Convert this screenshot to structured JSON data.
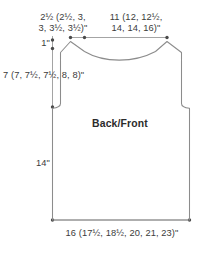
{
  "schematic": {
    "piece_name": "Back/Front",
    "labels": {
      "shoulder_width": "2½ (2½, 3,\n3, 3½, 3½)\"",
      "shoulder_width_line1": "2½ (2½, 3,",
      "shoulder_width_line2": "3, 3½, 3½)\"",
      "upper_width_line1": "11 (12, 12½,",
      "upper_width_line2": "14, 14, 16)\"",
      "neck_depth": "1\"",
      "armhole_depth": "7 (7, 7½, 7½, 8, 8)\"",
      "body_length": "14\"",
      "bottom_width": "16 (17½, 18½, 20, 21, 23)\""
    },
    "colors": {
      "outline": "#8c8c8c",
      "dimension_line": "#9a9a9a",
      "dimension_dot": "#4a4a4a",
      "text": "#3b3b3b",
      "title_text": "#2b2b2b",
      "background": "#ffffff"
    },
    "geometry": {
      "outline_path": "M 70.5 41.5 L 84.5 51.5 C 104 62.5 135 62.5 155.5 51.5 L 167 41.5 L 181.5 52.5 L 181.5 104.5 C 184 107 186 107.8 189.5 108.2 L 189.5 220 L 52.5 220 L 52.5 108.2 C 56 107.8 58 107 60.5 104.5 L 60.5 52.5 Z",
      "dimension_dots": [
        {
          "x": 70.5,
          "y": 37.5
        },
        {
          "x": 84.5,
          "y": 37.5
        },
        {
          "x": 167,
          "y": 37.5
        },
        {
          "x": 52.5,
          "y": 40
        },
        {
          "x": 52.5,
          "y": 48.5
        },
        {
          "x": 52.5,
          "y": 107
        },
        {
          "x": 52.5,
          "y": 220
        },
        {
          "x": 189.5,
          "y": 220
        }
      ]
    }
  }
}
